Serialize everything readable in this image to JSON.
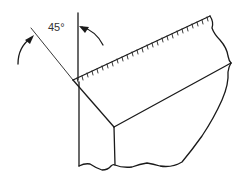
{
  "diagram": {
    "angle_label": "45°",
    "ink_color": "#1a1a1a",
    "background": "#ffffff"
  }
}
